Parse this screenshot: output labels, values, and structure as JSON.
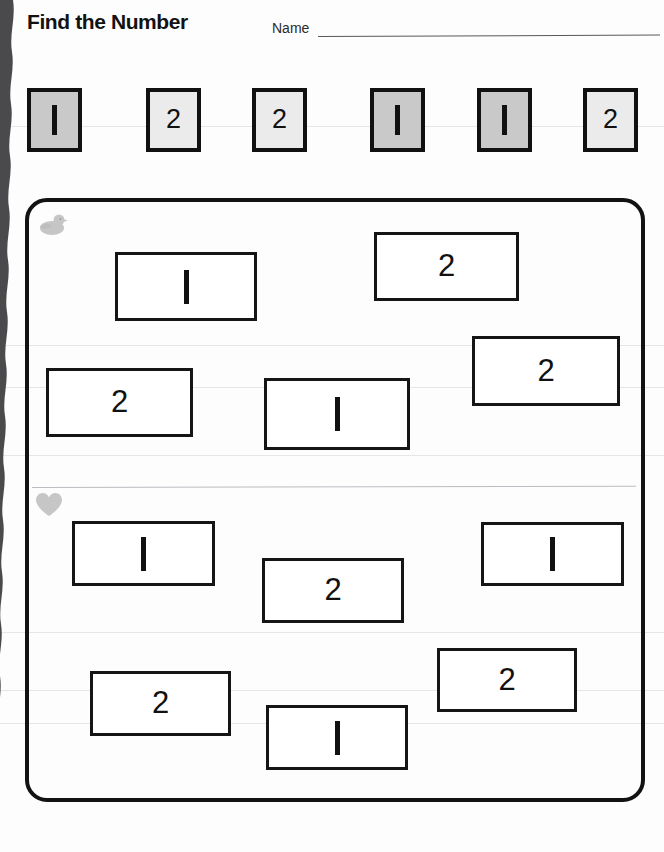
{
  "header": {
    "title": "Find the Number",
    "name_label": "Name",
    "name_value": ""
  },
  "key_row": {
    "squares": [
      {
        "value": "1",
        "shade": "dark",
        "x": 27
      },
      {
        "value": "2",
        "shade": "light",
        "x": 146
      },
      {
        "value": "2",
        "shade": "light",
        "x": 252
      },
      {
        "value": "1",
        "shade": "dark",
        "x": 370
      },
      {
        "value": "1",
        "shade": "dark",
        "x": 477
      },
      {
        "value": "2",
        "shade": "light",
        "x": 583
      }
    ]
  },
  "sections": [
    {
      "icon": "duck-icon",
      "boxes": [
        {
          "value": "1",
          "x": 115,
          "y": 252,
          "w": 142,
          "h": 69
        },
        {
          "value": "2",
          "x": 374,
          "y": 232,
          "w": 145,
          "h": 69
        },
        {
          "value": "2",
          "x": 46,
          "y": 368,
          "w": 147,
          "h": 69
        },
        {
          "value": "1",
          "x": 264,
          "y": 378,
          "w": 146,
          "h": 72
        },
        {
          "value": "2",
          "x": 472,
          "y": 336,
          "w": 148,
          "h": 70
        }
      ]
    },
    {
      "icon": "heart-icon",
      "boxes": [
        {
          "value": "1",
          "x": 72,
          "y": 521,
          "w": 143,
          "h": 65
        },
        {
          "value": "2",
          "x": 262,
          "y": 558,
          "w": 142,
          "h": 65
        },
        {
          "value": "1",
          "x": 481,
          "y": 522,
          "w": 143,
          "h": 64
        },
        {
          "value": "2",
          "x": 90,
          "y": 671,
          "w": 141,
          "h": 65
        },
        {
          "value": "1",
          "x": 266,
          "y": 705,
          "w": 142,
          "h": 65
        },
        {
          "value": "2",
          "x": 437,
          "y": 648,
          "w": 140,
          "h": 64
        }
      ]
    }
  ],
  "colors": {
    "ink": "#121212",
    "square_dark": "#c9c9c9",
    "square_light": "#ebebeb",
    "icon_gray": "#c6c6c6",
    "divider": "#b9bcc0"
  },
  "scan_lines": [
    126,
    345,
    387,
    455,
    632,
    690,
    723
  ]
}
